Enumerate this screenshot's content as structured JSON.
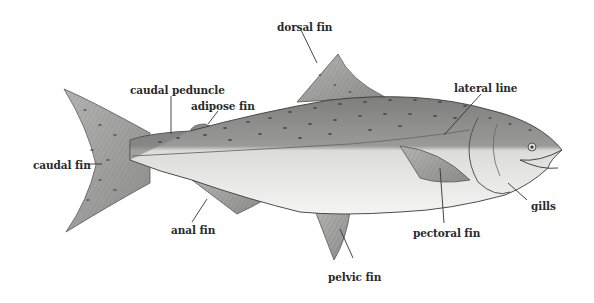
{
  "diagram": {
    "colors": {
      "back": "#8a8a88",
      "belly": "#ececea",
      "fin": "#a8a8a6",
      "outline": "#3a3a3a",
      "spot": "#555555",
      "label_text": "#2a2a2a",
      "leader_line": "#333333"
    },
    "labels": {
      "dorsal_fin": "dorsal fin",
      "caudal_peduncle": "caudal peduncle",
      "adipose_fin": "adipose fin",
      "lateral_line": "lateral line",
      "caudal_fin": "caudal fin",
      "anal_fin": "anal fin",
      "pelvic_fin": "pelvic fin",
      "pectoral_fin": "pectoral fin",
      "gills": "gills"
    }
  }
}
